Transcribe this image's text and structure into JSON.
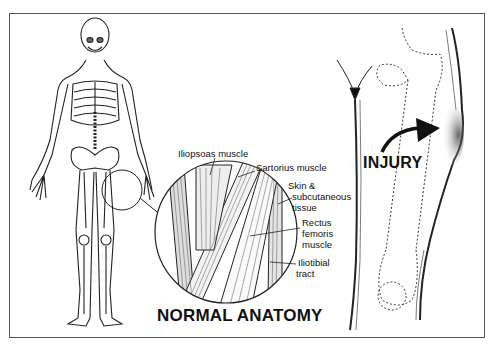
{
  "diagram": {
    "sections": {
      "normal": {
        "title": "NORMAL ANATOMY",
        "figure": "full-body-skeleton-with-thigh-highlight",
        "labels": {
          "iliopsoas": "Iliopsoas muscle",
          "sartorius": "Sartorius muscle",
          "skin_1": "Skin &",
          "skin_2": "subcutaneous",
          "skin_3": "tissue",
          "rectus_1": "Rectus",
          "rectus_2": "femoris",
          "rectus_3": "muscle",
          "iliotibial_1": "Iliotibial",
          "iliotibial_2": "tract"
        }
      },
      "injury": {
        "title": "INJURY",
        "figure": "thigh-with-swelling-and-arrow"
      }
    },
    "colors": {
      "ink": "#111111",
      "frame": "#555555",
      "background": "#ffffff"
    }
  }
}
